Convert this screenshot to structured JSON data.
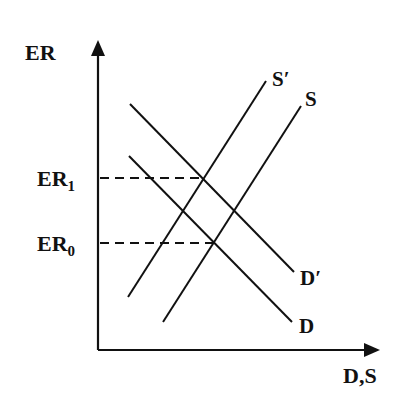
{
  "diagram": {
    "type": "supply-demand",
    "axes": {
      "y_label": "ER",
      "x_label": "D,S"
    },
    "curves": [
      {
        "id": "S_prime",
        "label": "S",
        "label_prime": "′",
        "kind": "supply",
        "from": [
          128,
          297
        ],
        "to": [
          266,
          81
        ]
      },
      {
        "id": "S",
        "label": "S",
        "label_prime": "",
        "kind": "supply",
        "from": [
          163,
          322
        ],
        "to": [
          301,
          106
        ]
      },
      {
        "id": "D_prime",
        "label": "D",
        "label_prime": "′",
        "kind": "demand",
        "from": [
          130,
          104
        ],
        "to": [
          294,
          272
        ]
      },
      {
        "id": "D",
        "label": "D",
        "label_prime": "",
        "kind": "demand",
        "from": [
          129,
          156
        ],
        "to": [
          292,
          322
        ]
      }
    ],
    "levels": [
      {
        "id": "ER1",
        "base": "ER",
        "sub": "1",
        "y": 178,
        "x_end": 203
      },
      {
        "id": "ER0",
        "base": "ER",
        "sub": "0",
        "y": 243,
        "x_end": 214
      }
    ],
    "colors": {
      "line": "#111111",
      "background": "#ffffff"
    }
  }
}
